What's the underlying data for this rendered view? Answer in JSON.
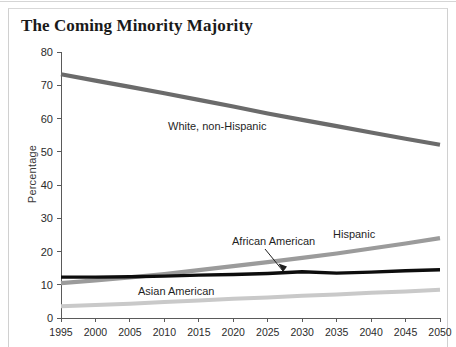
{
  "title": "The Coming Minority Majority",
  "axes": {
    "ylabel": "Percentage",
    "yticks": [
      "0",
      "10",
      "20",
      "30",
      "40",
      "50",
      "60",
      "70",
      "80"
    ],
    "xticks": [
      "1995",
      "2000",
      "2005",
      "2010",
      "2015",
      "2020",
      "2025",
      "2030",
      "2035",
      "2040",
      "2045",
      "2050"
    ]
  },
  "series_labels": {
    "white": "White, non-Hispanic",
    "hispanic": "Hispanic",
    "african_american": "African American",
    "asian_american": "Asian American"
  },
  "colors": {
    "white": "#6b6b6b",
    "hispanic": "#9b9b9b",
    "african_american": "#0d0d0d",
    "asian_american": "#c9c9c9",
    "axis": "#5a5a5a",
    "text": "#1f1f1f",
    "background": "#ffffff"
  },
  "chart_data": {
    "type": "line",
    "title": "The Coming Minority Majority",
    "xlabel": "",
    "ylabel": "Percentage",
    "xlim": [
      1995,
      2050
    ],
    "ylim": [
      0,
      80
    ],
    "grid": false,
    "legend": "inline-labels",
    "x": [
      1995,
      2000,
      2005,
      2010,
      2015,
      2020,
      2025,
      2030,
      2035,
      2040,
      2045,
      2050
    ],
    "series": [
      {
        "name": "White, non-Hispanic",
        "color": "#6b6b6b",
        "values": [
          73.3,
          71.4,
          69.5,
          67.6,
          65.6,
          63.6,
          61.5,
          59.6,
          57.7,
          55.8,
          53.9,
          52.1
        ]
      },
      {
        "name": "Hispanic",
        "color": "#9b9b9b",
        "values": [
          10.5,
          11.3,
          12.2,
          13.2,
          14.4,
          15.6,
          16.8,
          18.1,
          19.4,
          20.9,
          22.4,
          24.0
        ]
      },
      {
        "name": "African American",
        "color": "#0d0d0d",
        "values": [
          12.3,
          12.3,
          12.4,
          12.6,
          12.9,
          13.1,
          13.4,
          13.9,
          13.5,
          13.8,
          14.2,
          14.5
        ]
      },
      {
        "name": "Asian American",
        "color": "#c9c9c9",
        "values": [
          3.5,
          3.9,
          4.3,
          4.8,
          5.3,
          5.8,
          6.2,
          6.7,
          7.1,
          7.6,
          8.0,
          8.5
        ]
      }
    ]
  },
  "annotations": {
    "african_american_leader": "arrow pointing from African American label down to the black line"
  }
}
